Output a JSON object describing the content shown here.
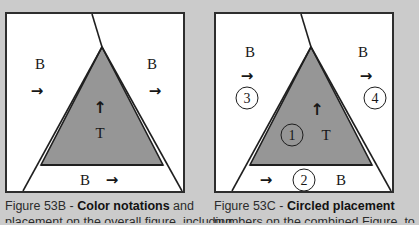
{
  "figures": [
    {
      "id": "fig-53b",
      "caption_prefix": "Figure 53B - ",
      "caption_bold": "Color notations",
      "caption_suffix": " and",
      "caption_line2": "placement on the overall figure, including",
      "labels": {
        "left_b": "B",
        "left_arrow": "→",
        "right_b": "B",
        "right_arrow": "→",
        "center_arrow_up": "↑",
        "center_t": "T",
        "bottom_b": "B",
        "bottom_arrow": "→"
      }
    },
    {
      "id": "fig-53c",
      "caption_prefix": "Figure 53C - ",
      "caption_bold": "Circled placement",
      "caption_suffix": "",
      "caption_line2": "numbers on the combined Figure, to",
      "labels": {
        "left_b": "B",
        "left_arrow": "→",
        "right_b": "B",
        "right_arrow": "→",
        "center_arrow_up": "↑",
        "center_t": "T",
        "bottom_b": "B",
        "bottom_arrow": "→"
      },
      "callouts": [
        {
          "number": "1",
          "x": 288,
          "y": 132
        },
        {
          "number": "2",
          "x": 300,
          "y": 178
        },
        {
          "number": "3",
          "x": 243,
          "y": 95
        },
        {
          "number": "4",
          "x": 371,
          "y": 95
        }
      ]
    }
  ],
  "colors": {
    "triangle_fill": "#969696",
    "stroke": "#1f1f1f",
    "panel_background": "#ffffff",
    "page_background": "#cbcbcb",
    "text": "#171717"
  }
}
